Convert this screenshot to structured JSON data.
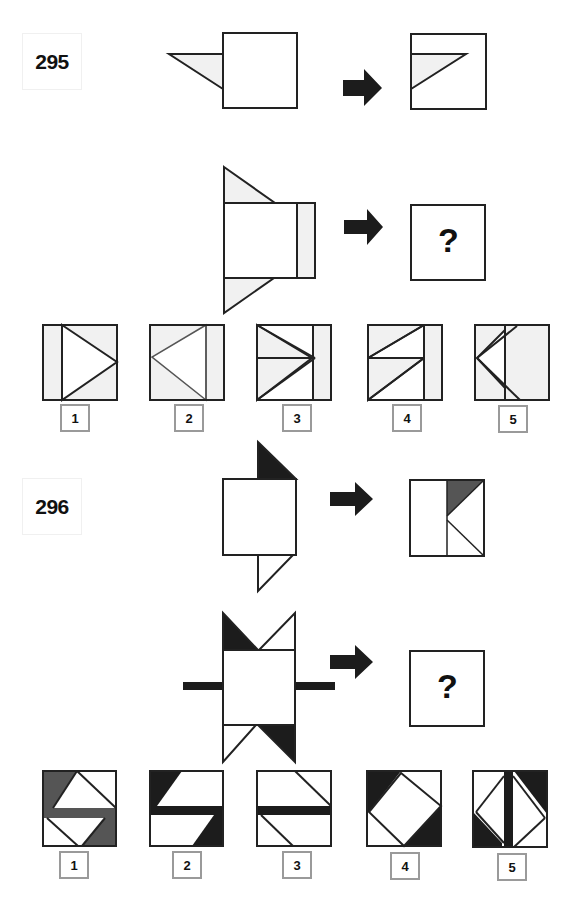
{
  "puzzles": [
    {
      "number": "295",
      "example": {
        "input": "square with light-gray triangle attached to left edge near top",
        "output": "square containing light-gray triangle folded inward from left edge"
      },
      "question": {
        "input": "square with light-gray triangles above and below left edge and light-gray strip on right",
        "output": "?"
      },
      "options": [
        {
          "label": "1"
        },
        {
          "label": "2"
        },
        {
          "label": "3"
        },
        {
          "label": "4"
        },
        {
          "label": "5"
        }
      ]
    },
    {
      "number": "296",
      "example": {
        "input": "square with black triangle on top-right and white triangle below",
        "output": "square with dark-gray triangle top-right and diagonal line bottom-right"
      },
      "question": {
        "input": "square with black and white triangles above and below and black bars left and right",
        "output": "?"
      },
      "options": [
        {
          "label": "1"
        },
        {
          "label": "2"
        },
        {
          "label": "3"
        },
        {
          "label": "4"
        },
        {
          "label": "5"
        }
      ]
    }
  ],
  "colors": {
    "stroke": "#222222",
    "light_fill": "#f1f1f1",
    "black_fill": "#1c1c1c",
    "gray_fill": "#555555",
    "label_border": "#9a9a9a"
  }
}
